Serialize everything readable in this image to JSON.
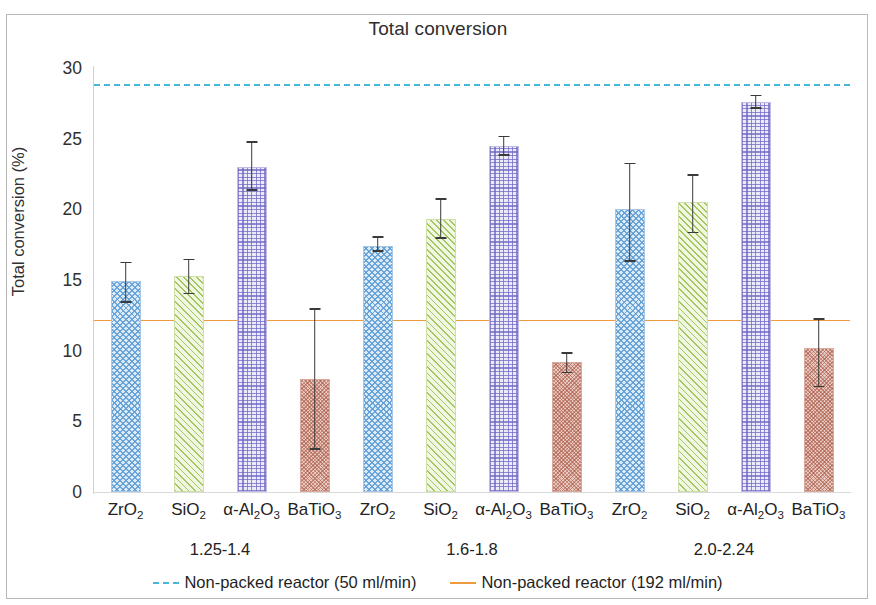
{
  "chart_data": {
    "type": "bar",
    "title": "Total conversion",
    "xlabel": "",
    "ylabel": "Total conversion (%)",
    "ylim": [
      0,
      30
    ],
    "yticks": [
      0,
      5,
      10,
      15,
      20,
      25,
      30
    ],
    "grid": false,
    "legend_position": "bottom",
    "categories": [
      "ZrO₂",
      "SiO₂",
      "α-Al₂O₃",
      "BaTiO₃",
      "ZrO₂",
      "SiO₂",
      "α-Al₂O₃",
      "BaTiO₃",
      "ZrO₂",
      "SiO₂",
      "α-Al₂O₃",
      "BaTiO₃"
    ],
    "category_labels_html": [
      "ZrO<sub>2</sub>",
      "SiO<sub>2</sub>",
      "α-Al<sub>2</sub>O<sub>3</sub>",
      "BaTiO<sub>3</sub>",
      "ZrO<sub>2</sub>",
      "SiO<sub>2</sub>",
      "α-Al<sub>2</sub>O<sub>3</sub>",
      "BaTiO<sub>3</sub>",
      "ZrO<sub>2</sub>",
      "SiO<sub>2</sub>",
      "α-Al<sub>2</sub>O<sub>3</sub>",
      "BaTiO<sub>3</sub>"
    ],
    "groups": [
      {
        "label": "1.25-1.4",
        "indices": [
          0,
          1,
          2,
          3
        ]
      },
      {
        "label": "1.6-1.8",
        "indices": [
          4,
          5,
          6,
          7
        ]
      },
      {
        "label": "2.0-2.24",
        "indices": [
          8,
          9,
          10,
          11
        ]
      }
    ],
    "values": [
      14.9,
      15.3,
      23.0,
      8.0,
      17.4,
      19.3,
      24.5,
      9.2,
      20.0,
      20.5,
      27.6,
      10.2
    ],
    "err_low": [
      13.4,
      14.0,
      21.3,
      3.0,
      17.0,
      17.9,
      23.8,
      8.4,
      16.3,
      18.3,
      27.1,
      7.4
    ],
    "err_high": [
      16.3,
      16.5,
      24.8,
      13.0,
      18.1,
      20.8,
      25.2,
      9.9,
      23.3,
      22.5,
      28.1,
      12.3
    ],
    "series_styles": [
      {
        "name": "ZrO2",
        "pattern": "checker",
        "color": "#5b9bd5"
      },
      {
        "name": "SiO2",
        "pattern": "diagonal",
        "color": "#92ba3e"
      },
      {
        "name": "Al2O3",
        "pattern": "crosshatch",
        "color": "#7068c4"
      },
      {
        "name": "BaTiO3",
        "pattern": "dots",
        "color": "#a85440"
      }
    ],
    "reference_lines": [
      {
        "label": "Non-packed reactor (50 ml/min)",
        "value": 28.9,
        "style": "dashed",
        "color": "#46b6d9"
      },
      {
        "label": "Non-packed reactor (192 ml/min)",
        "value": 12.2,
        "style": "solid",
        "color": "#ed9b3e"
      }
    ]
  }
}
